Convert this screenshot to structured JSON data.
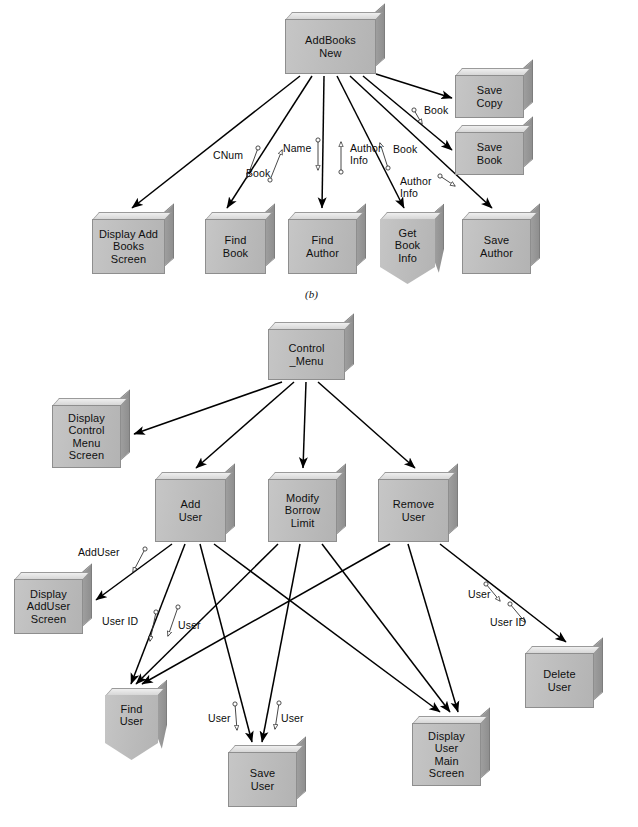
{
  "figure": {
    "caption_b": "(b)",
    "colors": {
      "box_face": "#bdbdbd",
      "box_top": "#dedede",
      "box_side": "#929292",
      "line": "#000000",
      "text": "#101010",
      "background": "#ffffff"
    }
  },
  "diagram_b": {
    "name": "AddBooksNew structure chart",
    "modules": [
      {
        "id": "addbooksnew",
        "label": "AddBooks\nNew",
        "type": "module",
        "x": 285,
        "y": 12,
        "w": 100,
        "h": 62
      },
      {
        "id": "savecopy",
        "label": "Save\nCopy",
        "type": "module",
        "x": 455,
        "y": 68,
        "w": 78,
        "h": 50
      },
      {
        "id": "savebook",
        "label": "Save\nBook",
        "type": "module",
        "x": 455,
        "y": 125,
        "w": 78,
        "h": 50
      },
      {
        "id": "displayadd",
        "label": "Display Add\nBooks\nScreen",
        "type": "module",
        "x": 92,
        "y": 212,
        "w": 82,
        "h": 62
      },
      {
        "id": "findbook",
        "label": "Find\nBook",
        "type": "module",
        "x": 205,
        "y": 212,
        "w": 70,
        "h": 62
      },
      {
        "id": "findauthor",
        "label": "Find\nAuthor",
        "type": "module",
        "x": 288,
        "y": 212,
        "w": 78,
        "h": 62
      },
      {
        "id": "getbookinfo",
        "label": "Get\nBook\nInfo",
        "type": "library",
        "x": 380,
        "y": 212,
        "w": 64,
        "h": 72
      },
      {
        "id": "saveauthor",
        "label": "Save\nAuthor",
        "type": "module",
        "x": 462,
        "y": 212,
        "w": 78,
        "h": 62
      }
    ],
    "calls": [
      {
        "from": "addbooksnew",
        "to": "displayadd",
        "x1": 300,
        "y1": 76,
        "x2": 132,
        "y2": 208
      },
      {
        "from": "addbooksnew",
        "to": "findbook",
        "x1": 312,
        "y1": 76,
        "x2": 227,
        "y2": 208
      },
      {
        "from": "addbooksnew",
        "to": "findauthor",
        "x1": 324,
        "y1": 76,
        "x2": 322,
        "y2": 208
      },
      {
        "from": "addbooksnew",
        "to": "getbookinfo",
        "x1": 337,
        "y1": 76,
        "x2": 404,
        "y2": 208
      },
      {
        "from": "addbooksnew",
        "to": "saveauthor",
        "x1": 350,
        "y1": 76,
        "x2": 492,
        "y2": 208
      },
      {
        "from": "addbooksnew",
        "to": "savebook",
        "x1": 363,
        "y1": 76,
        "x2": 452,
        "y2": 150
      },
      {
        "from": "addbooksnew",
        "to": "savecopy",
        "x1": 376,
        "y1": 74,
        "x2": 452,
        "y2": 98
      }
    ],
    "couples": [
      {
        "label": "CNum",
        "dir": "down",
        "text_x": 213,
        "text_y": 150,
        "ax": 258,
        "ay": 148,
        "bx": 247,
        "by": 178
      },
      {
        "label": "Book",
        "dir": "up",
        "text_x": 246,
        "text_y": 168,
        "ax": 270,
        "ay": 180,
        "bx": 282,
        "by": 150
      },
      {
        "label": "Name",
        "dir": "down",
        "text_x": 283,
        "text_y": 143,
        "ax": 318,
        "ay": 140,
        "bx": 318,
        "by": 170
      },
      {
        "label": "Author\nInfo",
        "dir": "up",
        "text_x": 350,
        "text_y": 143,
        "ax": 341,
        "ay": 172,
        "bx": 341,
        "by": 142
      },
      {
        "label": "Book",
        "dir": "up",
        "text_x": 393,
        "text_y": 144,
        "ax": 388,
        "ay": 168,
        "bx": 380,
        "by": 143
      },
      {
        "label": "Author\nInfo",
        "dir": "up",
        "text_x": 400,
        "text_y": 176,
        "ax": 440,
        "ay": 176,
        "bx": 455,
        "by": 186
      },
      {
        "label": "Book",
        "dir": "up",
        "text_x": 424,
        "text_y": 105,
        "ax": 414,
        "ay": 110,
        "bx": 422,
        "by": 124
      }
    ]
  },
  "diagram_c": {
    "name": "Control_Menu structure chart",
    "modules": [
      {
        "id": "controlmenu",
        "label": "Control\n_Menu",
        "type": "module",
        "x": 268,
        "y": 322,
        "w": 86,
        "h": 58
      },
      {
        "id": "dispctrl",
        "label": "Display\nControl\nMenu\nScreen",
        "type": "module",
        "x": 52,
        "y": 398,
        "w": 78,
        "h": 70
      },
      {
        "id": "adduser",
        "label": "Add\nUser",
        "type": "module",
        "x": 155,
        "y": 472,
        "w": 80,
        "h": 70
      },
      {
        "id": "modifyborrow",
        "label": "Modify\nBorrow\nLimit",
        "type": "module",
        "x": 268,
        "y": 472,
        "w": 78,
        "h": 70
      },
      {
        "id": "removeuser",
        "label": "Remove\nUser",
        "type": "module",
        "x": 378,
        "y": 472,
        "w": 80,
        "h": 70
      },
      {
        "id": "dispadduser",
        "label": "Display\nAddUser\nScreen",
        "type": "module",
        "x": 14,
        "y": 572,
        "w": 78,
        "h": 62
      },
      {
        "id": "finduser",
        "label": "Find\nUser",
        "type": "library",
        "x": 105,
        "y": 688,
        "w": 62,
        "h": 72
      },
      {
        "id": "saveuser",
        "label": "Save\nUser",
        "type": "module",
        "x": 228,
        "y": 745,
        "w": 78,
        "h": 62
      },
      {
        "id": "dispusermain",
        "label": "Display\nUser\nMain\nScreen",
        "type": "module",
        "x": 412,
        "y": 716,
        "w": 78,
        "h": 70
      },
      {
        "id": "deleteuser",
        "label": "Delete\nUser",
        "type": "module",
        "x": 525,
        "y": 646,
        "w": 78,
        "h": 62
      }
    ],
    "calls": [
      {
        "from": "controlmenu",
        "to": "dispctrl",
        "x1": 282,
        "y1": 382,
        "x2": 134,
        "y2": 434
      },
      {
        "from": "controlmenu",
        "to": "adduser",
        "x1": 294,
        "y1": 382,
        "x2": 196,
        "y2": 468
      },
      {
        "from": "controlmenu",
        "to": "modifyborrow",
        "x1": 306,
        "y1": 382,
        "x2": 303,
        "y2": 468
      },
      {
        "from": "controlmenu",
        "to": "removeuser",
        "x1": 318,
        "y1": 382,
        "x2": 415,
        "y2": 468
      },
      {
        "from": "adduser",
        "to": "dispadduser",
        "x1": 172,
        "y1": 544,
        "x2": 96,
        "y2": 600
      },
      {
        "from": "adduser",
        "to": "finduser",
        "x1": 185,
        "y1": 544,
        "x2": 131,
        "y2": 684
      },
      {
        "from": "adduser",
        "to": "saveuser",
        "x1": 200,
        "y1": 544,
        "x2": 252,
        "y2": 742
      },
      {
        "from": "adduser",
        "to": "dispusermain",
        "x1": 214,
        "y1": 544,
        "x2": 440,
        "y2": 712
      },
      {
        "from": "modifyborrow",
        "to": "finduser",
        "x1": 278,
        "y1": 544,
        "x2": 136,
        "y2": 684
      },
      {
        "from": "modifyborrow",
        "to": "saveuser",
        "x1": 300,
        "y1": 544,
        "x2": 262,
        "y2": 742
      },
      {
        "from": "modifyborrow",
        "to": "dispusermain",
        "x1": 322,
        "y1": 544,
        "x2": 450,
        "y2": 712
      },
      {
        "from": "removeuser",
        "to": "finduser",
        "x1": 390,
        "y1": 544,
        "x2": 142,
        "y2": 684
      },
      {
        "from": "removeuser",
        "to": "dispusermain",
        "x1": 408,
        "y1": 544,
        "x2": 458,
        "y2": 712
      },
      {
        "from": "removeuser",
        "to": "deleteuser",
        "x1": 440,
        "y1": 544,
        "x2": 566,
        "y2": 642
      }
    ],
    "couples": [
      {
        "label": "AddUser",
        "dir": "down",
        "text_x": 78,
        "text_y": 547,
        "ax": 145,
        "ay": 549,
        "bx": 133,
        "by": 572
      },
      {
        "label": "User ID",
        "dir": "down",
        "text_x": 102,
        "text_y": 616,
        "ax": 156,
        "ay": 612,
        "bx": 150,
        "by": 641
      },
      {
        "label": "User",
        "dir": "down",
        "text_x": 178,
        "text_y": 620,
        "ax": 178,
        "ay": 607,
        "bx": 168,
        "by": 636
      },
      {
        "label": "User",
        "dir": "down",
        "text_x": 208,
        "text_y": 713,
        "ax": 235,
        "ay": 704,
        "bx": 237,
        "by": 730
      },
      {
        "label": "User",
        "dir": "down",
        "text_x": 281,
        "text_y": 713,
        "ax": 279,
        "ay": 703,
        "bx": 275,
        "by": 729
      },
      {
        "label": "User",
        "dir": "down",
        "text_x": 468,
        "text_y": 589,
        "ax": 486,
        "ay": 584,
        "bx": 500,
        "by": 601
      },
      {
        "label": "User ID",
        "dir": "down",
        "text_x": 490,
        "text_y": 617,
        "ax": 510,
        "ay": 604,
        "bx": 525,
        "by": 622
      }
    ]
  }
}
